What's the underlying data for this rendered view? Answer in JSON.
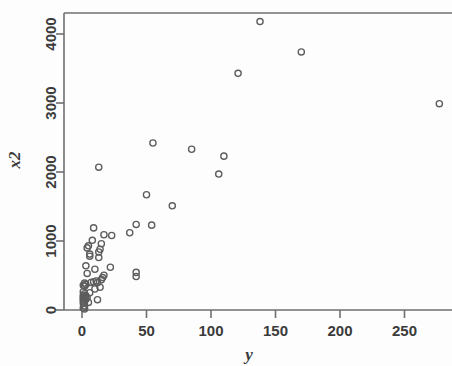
{
  "chart_data": {
    "type": "scatter",
    "title": "",
    "xlabel": "y",
    "ylabel": "x2",
    "xlim": [
      -8,
      290
    ],
    "ylim": [
      -150,
      4400
    ],
    "grid": false,
    "legend": null,
    "marker": "open-circle",
    "marker_color": "#5d5d5d",
    "xticks": [
      0,
      50,
      100,
      150,
      200,
      250
    ],
    "xtick_labels": [
      "0",
      "50",
      "100",
      "150",
      "200",
      "250"
    ],
    "yticks": [
      0,
      1000,
      2000,
      3000,
      4000
    ],
    "ytick_labels": [
      "0",
      "1000",
      "2000",
      "3000",
      "4000"
    ],
    "points": [
      {
        "x": 138,
        "y": 4180
      },
      {
        "x": 170,
        "y": 3740
      },
      {
        "x": 121,
        "y": 3430
      },
      {
        "x": 277,
        "y": 2990
      },
      {
        "x": 55,
        "y": 2420
      },
      {
        "x": 85,
        "y": 2330
      },
      {
        "x": 110,
        "y": 2230
      },
      {
        "x": 13,
        "y": 2070
      },
      {
        "x": 106,
        "y": 1970
      },
      {
        "x": 50,
        "y": 1670
      },
      {
        "x": 70,
        "y": 1510
      },
      {
        "x": 42,
        "y": 1240
      },
      {
        "x": 54,
        "y": 1230
      },
      {
        "x": 9,
        "y": 1190
      },
      {
        "x": 37,
        "y": 1120
      },
      {
        "x": 23,
        "y": 1080
      },
      {
        "x": 17,
        "y": 1090
      },
      {
        "x": 8,
        "y": 1010
      },
      {
        "x": 15,
        "y": 960
      },
      {
        "x": 5,
        "y": 930
      },
      {
        "x": 4,
        "y": 900
      },
      {
        "x": 14,
        "y": 880
      },
      {
        "x": 13,
        "y": 840
      },
      {
        "x": 6,
        "y": 810
      },
      {
        "x": 6,
        "y": 780
      },
      {
        "x": 13,
        "y": 760
      },
      {
        "x": 3,
        "y": 640
      },
      {
        "x": 22,
        "y": 620
      },
      {
        "x": 10,
        "y": 590
      },
      {
        "x": 42,
        "y": 545
      },
      {
        "x": 4,
        "y": 530
      },
      {
        "x": 17,
        "y": 505
      },
      {
        "x": 42,
        "y": 485
      },
      {
        "x": 16,
        "y": 470
      },
      {
        "x": 15,
        "y": 440
      },
      {
        "x": 11,
        "y": 420
      },
      {
        "x": 9,
        "y": 410
      },
      {
        "x": 7,
        "y": 400
      },
      {
        "x": 12,
        "y": 395
      },
      {
        "x": 2,
        "y": 390
      },
      {
        "x": 3,
        "y": 370
      },
      {
        "x": 1,
        "y": 360
      },
      {
        "x": 2,
        "y": 345
      },
      {
        "x": 14,
        "y": 330
      },
      {
        "x": 10,
        "y": 305
      },
      {
        "x": 1,
        "y": 265
      },
      {
        "x": 6,
        "y": 250
      },
      {
        "x": 2,
        "y": 235
      },
      {
        "x": 1,
        "y": 215
      },
      {
        "x": 3,
        "y": 205
      },
      {
        "x": 2,
        "y": 195
      },
      {
        "x": 1,
        "y": 185
      },
      {
        "x": 4,
        "y": 180
      },
      {
        "x": 2,
        "y": 170
      },
      {
        "x": 1,
        "y": 160
      },
      {
        "x": 3,
        "y": 155
      },
      {
        "x": 12,
        "y": 150
      },
      {
        "x": 1,
        "y": 130
      },
      {
        "x": 2,
        "y": 120
      },
      {
        "x": 5,
        "y": 110
      },
      {
        "x": 1,
        "y": 95
      },
      {
        "x": 2,
        "y": 60
      },
      {
        "x": 1,
        "y": 30
      },
      {
        "x": 2,
        "y": 15
      }
    ]
  }
}
